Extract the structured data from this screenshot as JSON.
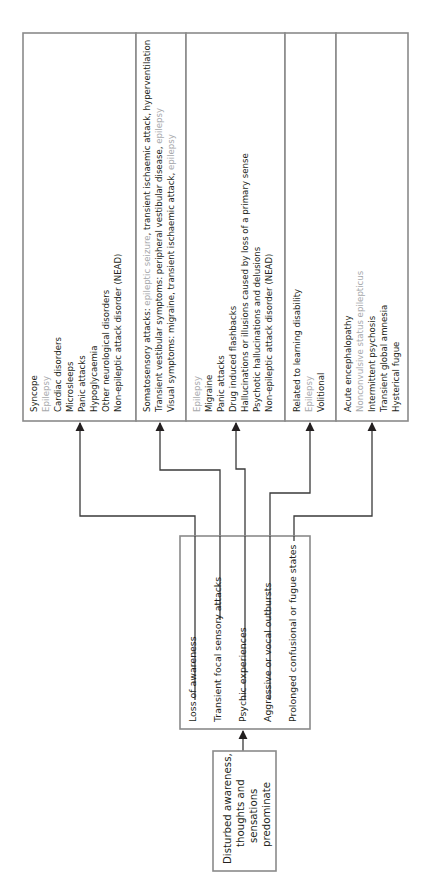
{
  "diagram": {
    "orientation": "rotated 90 degrees counter-clockwise (text reads bottom-to-top)",
    "source_box": {
      "lines": [
        "Disturbed awareness,",
        "thoughts and",
        "sensations",
        "predominate"
      ]
    },
    "symptom_box": {
      "items": [
        "Loss of awareness",
        "Transient focal sensory attacks",
        "Psychic experiences",
        "Aggressive or vocal outbursts",
        "Prolonged confusional or fugue states"
      ]
    },
    "diagnosis_boxes": [
      {
        "lines": [
          {
            "text": "Syncope",
            "gray": false
          },
          {
            "text": "Epilepsy",
            "gray": true
          },
          {
            "text": "Cardiac disorders",
            "gray": false
          },
          {
            "text": "Microsleeps",
            "gray": false
          },
          {
            "text": "Panic attacks",
            "gray": false
          },
          {
            "text": "Hypoglycaemia",
            "gray": false
          },
          {
            "text": "Other neurological disorders",
            "gray": false
          },
          {
            "text": "Non-epileptic attack disorder (NEAD)",
            "gray": false
          }
        ]
      },
      {
        "lines": [
          {
            "parts": [
              {
                "text": "Somatosensory attacks: ",
                "gray": false
              },
              {
                "text": "epileptic seizure",
                "gray": true
              },
              {
                "text": ", transient ischaemic attack, hyperventilation",
                "gray": false
              }
            ]
          },
          {
            "parts": [
              {
                "text": "Transient vestibular symptoms:  peripheral vestibular disease, ",
                "gray": false
              },
              {
                "text": "epilepsy",
                "gray": true
              }
            ]
          },
          {
            "parts": [
              {
                "text": "Visual symptoms:  migraine, transient ischaemic attack, ",
                "gray": false
              },
              {
                "text": "epilepsy",
                "gray": true
              }
            ]
          }
        ]
      },
      {
        "lines": [
          {
            "text": "Epilepsy",
            "gray": true
          },
          {
            "text": "Migraine",
            "gray": false
          },
          {
            "text": "Panic attacks",
            "gray": false
          },
          {
            "text": "Drug induced flashbacks",
            "gray": false
          },
          {
            "text": "Hallucinations or illusions caused by loss of a primary sense",
            "gray": false
          },
          {
            "text": "Psychotic hallucinations and delusions",
            "gray": false
          },
          {
            "text": "Non-epileptic attack disorder (NEAD)",
            "gray": false
          }
        ]
      },
      {
        "lines": [
          {
            "text": "Related to learning disability",
            "gray": false
          },
          {
            "text": "Epilepsy",
            "gray": true
          },
          {
            "text": "Volitional",
            "gray": false
          }
        ]
      },
      {
        "lines": [
          {
            "text": "Acute encephalopathy",
            "gray": false
          },
          {
            "text": "Nonconvulsive status epilepticus",
            "gray": true
          },
          {
            "text": "Intermittent psychosis",
            "gray": false
          },
          {
            "text": "Transient global amnesia",
            "gray": false
          },
          {
            "text": "Hysterical fugue",
            "gray": false
          }
        ]
      }
    ],
    "colors": {
      "text": "#231f20",
      "highlight_gray": "#a7a9ac",
      "box_border": "#8a8a8a",
      "connector": "#3a3a3a"
    }
  }
}
